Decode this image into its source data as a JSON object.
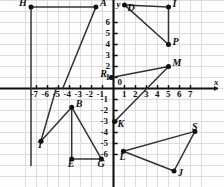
{
  "figure": {
    "type": "coordinate-plane-point-plot",
    "background": "#fdfdfd",
    "grid_color": "#d8d8dc",
    "axis_color": "#111111",
    "point_color": "#111111",
    "segment_color": "#333333",
    "axis_labels": {
      "x": "x",
      "y": "y",
      "origin": "0"
    },
    "x_ticks": [
      -7,
      -6,
      -5,
      -4,
      -3,
      -2,
      -1,
      1,
      2,
      3,
      4,
      5,
      6,
      7
    ],
    "y_ticks": [
      6,
      5,
      4,
      3,
      2,
      1,
      -1,
      -2,
      -3,
      -4,
      -5,
      -6
    ],
    "x_tick_labels": [
      "-7",
      "-6",
      "-5",
      "-4",
      "-3",
      "-2",
      "-1",
      "1",
      "2",
      "3",
      "4",
      "5",
      "6",
      "7"
    ],
    "y_tick_labels": [
      "6",
      "5",
      "4",
      "3",
      "2",
      "1",
      "-1",
      "-2",
      "-3",
      "-4",
      "-5",
      "-6"
    ],
    "x_range": [
      -8,
      8
    ],
    "y_range": [
      -8,
      8
    ],
    "grid": true
  },
  "points": [
    {
      "name": "H",
      "label": "H",
      "x": -7.5,
      "y": 7.4,
      "label_dx": -12,
      "label_dy": -4
    },
    {
      "name": "A",
      "label": "A",
      "x": -1.6,
      "y": 7.4,
      "label_dx": 4,
      "label_dy": -4
    },
    {
      "name": "D",
      "label": "D",
      "x": 1.0,
      "y": 7.6,
      "label_dx": 3,
      "label_dy": 3
    },
    {
      "name": "I",
      "label": "I",
      "x": 5.0,
      "y": 7.4,
      "label_dx": 4,
      "label_dy": -3
    },
    {
      "name": "P",
      "label": "P",
      "x": 5.0,
      "y": 4.0,
      "label_dx": 4,
      "label_dy": -3
    },
    {
      "name": "M",
      "label": "M",
      "x": 5.0,
      "y": 2.0,
      "label_dx": 4,
      "label_dy": -4
    },
    {
      "name": "R",
      "label": "R",
      "x": -0.2,
      "y": 1.0,
      "label_dx": -11,
      "label_dy": -4
    },
    {
      "name": "K",
      "label": "K",
      "x": 0.1,
      "y": -3.0,
      "label_dx": 3,
      "label_dy": 2
    },
    {
      "name": "B",
      "label": "B",
      "x": -3.8,
      "y": -1.7,
      "label_dx": 4,
      "label_dy": -3
    },
    {
      "name": "T",
      "label": "T",
      "x": -6.6,
      "y": -4.8,
      "label_dx": -4,
      "label_dy": 4
    },
    {
      "name": "E",
      "label": "E",
      "x": -3.8,
      "y": -6.4,
      "label_dx": -4,
      "label_dy": 5
    },
    {
      "name": "G",
      "label": "G",
      "x": -1.1,
      "y": -6.4,
      "label_dx": -4,
      "label_dy": 5
    },
    {
      "name": "L",
      "label": "L",
      "x": 0.9,
      "y": -5.7,
      "label_dx": -4,
      "label_dy": 6
    },
    {
      "name": "S",
      "label": "S",
      "x": 7.4,
      "y": -3.9,
      "label_dx": -3,
      "label_dy": -4
    },
    {
      "name": "J",
      "label": "J",
      "x": 5.5,
      "y": -7.5,
      "label_dx": 4,
      "label_dy": 2
    }
  ],
  "segments": [
    {
      "name": "segment-H-A",
      "from": "H",
      "to": "A"
    },
    {
      "name": "segment-A-foot",
      "from": "A",
      "to": "A_foot"
    },
    {
      "name": "segment-H-Hfoot",
      "from": "H",
      "to": "H_foot"
    },
    {
      "name": "segment-D-I",
      "from": "D",
      "to": "I"
    },
    {
      "name": "segment-D-P",
      "from": "D",
      "to": "P"
    },
    {
      "name": "segment-I-P",
      "from": "I",
      "to": "P"
    },
    {
      "name": "segment-R-M",
      "from": "R",
      "to": "M"
    },
    {
      "name": "segment-M-K",
      "from": "M",
      "to": "K"
    },
    {
      "name": "segment-B-T",
      "from": "B",
      "to": "T"
    },
    {
      "name": "segment-B-E",
      "from": "B",
      "to": "E"
    },
    {
      "name": "segment-B-G",
      "from": "B",
      "to": "G"
    },
    {
      "name": "segment-E-G",
      "from": "E",
      "to": "G"
    },
    {
      "name": "segment-T-Ttop",
      "from": "T",
      "to": "T_top"
    },
    {
      "name": "segment-L-S",
      "from": "L",
      "to": "S"
    },
    {
      "name": "segment-L-J",
      "from": "L",
      "to": "J"
    },
    {
      "name": "segment-S-J",
      "from": "S",
      "to": "J"
    }
  ]
}
